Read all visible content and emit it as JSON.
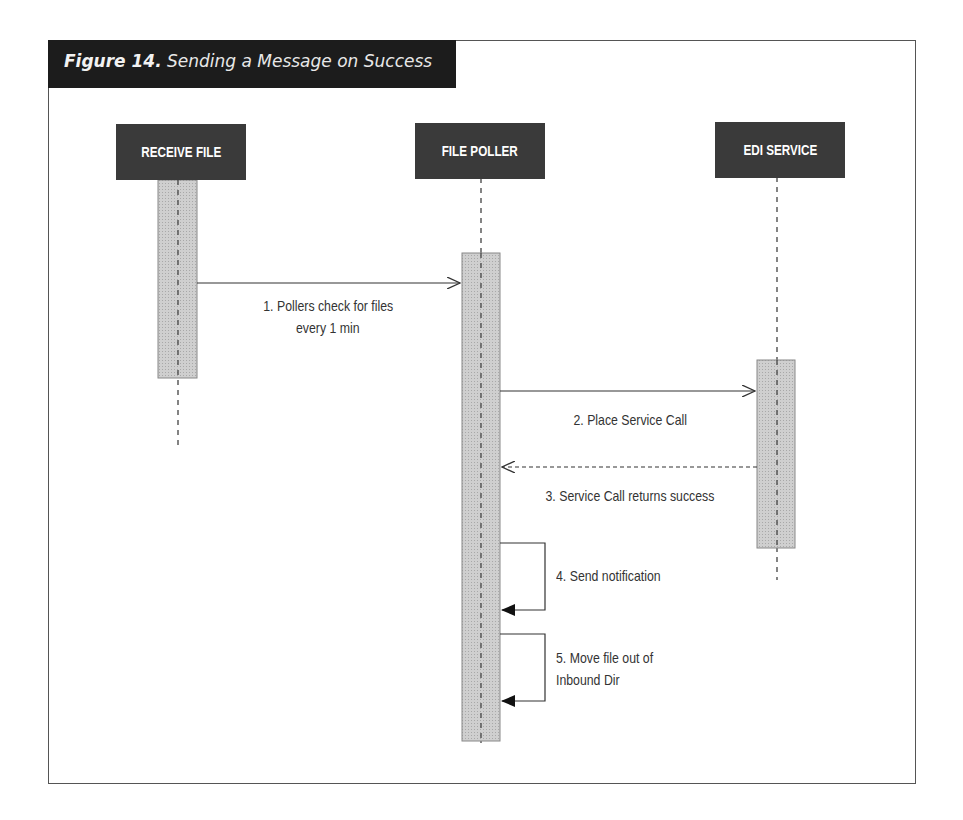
{
  "figure": {
    "number_label": "Figure 14.",
    "caption": "Sending a Message on Success"
  },
  "actors": [
    {
      "id": "receive-file",
      "label": "RECEIVE FILE"
    },
    {
      "id": "file-poller",
      "label": "FILE POLLER"
    },
    {
      "id": "edi-service",
      "label": "EDI SERVICE"
    }
  ],
  "messages": [
    {
      "step": 1,
      "from": "RECEIVE FILE",
      "to": "FILE POLLER",
      "type": "sync",
      "line1": "1. Pollers check for files",
      "line2": "every 1 min"
    },
    {
      "step": 2,
      "from": "FILE POLLER",
      "to": "EDI SERVICE",
      "type": "sync",
      "line1": "2. Place Service Call"
    },
    {
      "step": 3,
      "from": "EDI SERVICE",
      "to": "FILE POLLER",
      "type": "return",
      "line1": "3. Service Call returns success"
    },
    {
      "step": 4,
      "from": "FILE POLLER",
      "to": "FILE POLLER",
      "type": "self",
      "line1": "4. Send notification"
    },
    {
      "step": 5,
      "from": "FILE POLLER",
      "to": "FILE POLLER",
      "type": "self",
      "line1": "5. Move file out of",
      "line2": "Inbound Dir"
    }
  ],
  "colors": {
    "header_bg": "#1c1c1c",
    "actor_bg": "#3a3a3a",
    "activation_fill": "#c8c8c8",
    "line": "#333333"
  }
}
